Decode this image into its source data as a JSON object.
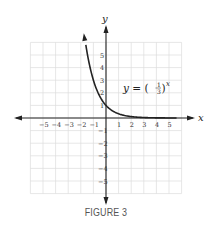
{
  "chart_data": {
    "type": "line",
    "title": "",
    "equation_label": "y = (1/3)^x",
    "equation": {
      "lhs": "y",
      "eq": "=",
      "num": "1",
      "den": "3",
      "exp": "x"
    },
    "xlabel": "x",
    "ylabel": "y",
    "xlim": [
      -6,
      6
    ],
    "ylim": [
      -6,
      6
    ],
    "grid": true,
    "x_ticks": [
      -5,
      -4,
      -3,
      -2,
      -1,
      1,
      2,
      3,
      4,
      5
    ],
    "y_ticks": [
      5,
      4,
      3,
      2,
      1,
      -1,
      -2,
      -3,
      -4,
      -5
    ],
    "x_tick_labels": [
      "−5",
      "−4",
      "−3",
      "−2",
      "−1",
      "1",
      "2",
      "3",
      "4",
      "5"
    ],
    "y_tick_labels": [
      "5",
      "4",
      "3",
      "2",
      "1",
      "−1",
      "−2",
      "−3",
      "−4",
      "−5"
    ],
    "series": [
      {
        "name": "y = (1/3)^x",
        "x": [
          -1.65,
          -1.5,
          -1.25,
          -1,
          -0.75,
          -0.5,
          -0.25,
          0,
          0.5,
          1,
          1.5,
          2,
          3,
          4,
          5
        ],
        "values": [
          6.13,
          5.2,
          3.95,
          3,
          2.28,
          1.73,
          1.32,
          1,
          0.58,
          0.33,
          0.19,
          0.11,
          0.04,
          0.01,
          0.004
        ]
      }
    ],
    "colors": {
      "curve": "#222222",
      "axes": "#222222",
      "grid": "#dddddd"
    }
  },
  "caption": "FIGURE 3"
}
